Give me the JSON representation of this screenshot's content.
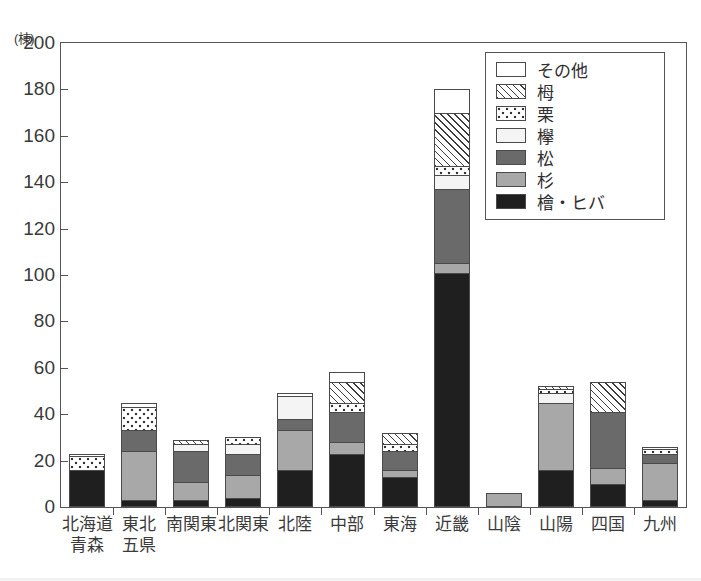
{
  "axis": {
    "y_unit_label": "(棟)",
    "y_ticks": [
      "0",
      "20",
      "40",
      "60",
      "80",
      "100",
      "120",
      "140",
      "160",
      "180",
      "200"
    ]
  },
  "legend": {
    "items": [
      {
        "label": "その他",
        "pattern": "solid-white",
        "color": "#ffffff"
      },
      {
        "label": "栂",
        "pattern": "diagonal-hatch",
        "color": "#3c3c3c"
      },
      {
        "label": "栗",
        "pattern": "dotted",
        "color": "#333333"
      },
      {
        "label": "欅",
        "pattern": "solid-light",
        "color": "#f4f4f4"
      },
      {
        "label": "松",
        "pattern": "solid-dark-gray",
        "color": "#6a6a6a"
      },
      {
        "label": "杉",
        "pattern": "solid-mid-gray",
        "color": "#a8a8a8"
      },
      {
        "label": "檜・ヒバ",
        "pattern": "solid-black",
        "color": "#1f1f1f"
      }
    ]
  },
  "chart_data": {
    "type": "bar",
    "subtype": "stacked",
    "title": "",
    "xlabel": "",
    "ylabel": "(棟)",
    "ylim": [
      0,
      200
    ],
    "ytick_step": 20,
    "grid": false,
    "legend_position": "top-right",
    "categories": [
      "北海道\n青森",
      "東北\n五県",
      "南関東",
      "北関東",
      "北陸",
      "中部",
      "東海",
      "近畿",
      "山陰",
      "山陽",
      "四国",
      "九州"
    ],
    "category_lines": [
      [
        "北海道",
        "青森"
      ],
      [
        "東北",
        "五県"
      ],
      [
        "南関東",
        ""
      ],
      [
        "北関東",
        ""
      ],
      [
        "北陸",
        ""
      ],
      [
        "中部",
        ""
      ],
      [
        "東海",
        ""
      ],
      [
        "近畿",
        ""
      ],
      [
        "山陰",
        ""
      ],
      [
        "山陽",
        ""
      ],
      [
        "四国",
        ""
      ],
      [
        "九州",
        ""
      ]
    ],
    "series": [
      {
        "name": "檜・ヒバ",
        "fill": "f-hinoki",
        "values": [
          16,
          3,
          3,
          4,
          16,
          23,
          13,
          101,
          0,
          16,
          10,
          3
        ]
      },
      {
        "name": "杉",
        "fill": "f-sugi",
        "values": [
          0,
          21,
          8,
          10,
          17,
          5,
          3,
          4,
          6,
          29,
          7,
          16
        ]
      },
      {
        "name": "松",
        "fill": "f-matsu",
        "values": [
          0,
          9,
          13,
          9,
          5,
          13,
          8,
          32,
          0,
          0,
          24,
          4
        ]
      },
      {
        "name": "欅",
        "fill": "f-keyaki",
        "values": [
          0,
          0,
          3,
          4,
          10,
          0,
          0,
          6,
          0,
          4,
          0,
          0
        ]
      },
      {
        "name": "栗",
        "fill": "f-kuri",
        "values": [
          6,
          10,
          0,
          3,
          0,
          4,
          3,
          4,
          0,
          2,
          0,
          2
        ]
      },
      {
        "name": "栂",
        "fill": "f-toga",
        "values": [
          0,
          0,
          2,
          0,
          0,
          9,
          5,
          23,
          0,
          1,
          13,
          0
        ]
      },
      {
        "name": "その他",
        "fill": "f-sonota",
        "values": [
          1,
          2,
          0,
          0,
          1,
          4,
          0,
          10,
          0,
          0,
          0,
          1
        ]
      }
    ],
    "totals": [
      23,
      45,
      29,
      30,
      49,
      58,
      32,
      180,
      6,
      52,
      54,
      26
    ]
  }
}
